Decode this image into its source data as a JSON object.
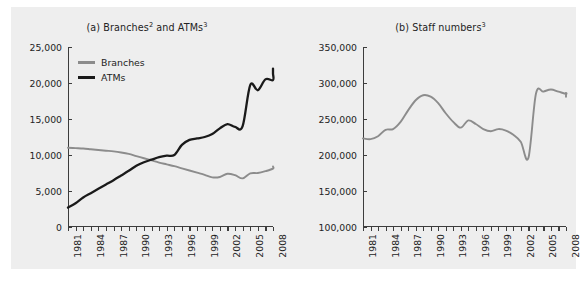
{
  "figure": {
    "background": "#eeeeee",
    "page_background": "#ffffff"
  },
  "panel_a": {
    "title_prefix": "(a) Branches",
    "title_sup1": "2",
    "title_mid": " and ATMs",
    "title_sup2": "3",
    "title_full": "(a) Branches2 and ATMs3"
  },
  "panel_b": {
    "title_prefix": "(b) Staff numbers",
    "title_sup1": "3",
    "title_full": "(b) Staff numbers3"
  },
  "legend": {
    "branches_label": "Branches",
    "branches_color": "#8c8c8c",
    "atms_label": "ATMs",
    "atms_color": "#1a1a1a"
  },
  "chart_data": [
    {
      "type": "line",
      "title": "(a) Branches2 and ATMs3",
      "xlabel": "",
      "ylabel": "",
      "xlim": [
        1981,
        2008
      ],
      "ylim": [
        0,
        25000
      ],
      "yticks": [
        0,
        5000,
        10000,
        15000,
        20000,
        25000
      ],
      "ytick_labels": [
        "0",
        "5,000",
        "10,000",
        "15,000",
        "20,000",
        "25,000"
      ],
      "xticks": [
        1981,
        1984,
        1987,
        1990,
        1993,
        1996,
        1999,
        2002,
        2005,
        2008
      ],
      "xtick_labels": [
        "1981",
        "1984",
        "1987",
        "1990",
        "1993",
        "1996",
        "1999",
        "2002",
        "2005",
        "2008"
      ],
      "x": [
        1981,
        1982,
        1983,
        1984,
        1985,
        1986,
        1987,
        1988,
        1989,
        1990,
        1991,
        1992,
        1993,
        1994,
        1995,
        1996,
        1997,
        1998,
        1999,
        2000,
        2001,
        2002,
        2003,
        2004,
        2005,
        2006,
        2007,
        2008
      ],
      "grid": false,
      "legend_position": "upper-left",
      "series": [
        {
          "name": "Branches",
          "color": "#8c8c8c",
          "values": [
            11000,
            10950,
            10900,
            10800,
            10700,
            10600,
            10500,
            10350,
            10150,
            9850,
            9550,
            9250,
            8950,
            8700,
            8450,
            8150,
            7850,
            7550,
            7250,
            6900,
            6950,
            7400,
            7200,
            6750,
            7450,
            7500,
            7750,
            8100,
            8400
          ]
        },
        {
          "name": "ATMs",
          "color": "#1a1a1a",
          "values": [
            2700,
            3300,
            4100,
            4700,
            5300,
            5900,
            6500,
            7150,
            7800,
            8500,
            9000,
            9350,
            9700,
            9900,
            10000,
            11400,
            12100,
            12300,
            12500,
            12900,
            13700,
            14300,
            13900,
            14000,
            19700,
            19000,
            20500,
            20400,
            21300,
            21700,
            22000
          ]
        }
      ]
    },
    {
      "type": "line",
      "title": "(b) Staff numbers3",
      "xlabel": "",
      "ylabel": "",
      "xlim": [
        1981,
        2008
      ],
      "ylim": [
        100000,
        350000
      ],
      "yticks": [
        100000,
        150000,
        200000,
        250000,
        300000,
        350000
      ],
      "ytick_labels": [
        "100,000",
        "150,000",
        "200,000",
        "250,000",
        "300,000",
        "350,000"
      ],
      "xticks": [
        1981,
        1984,
        1987,
        1990,
        1993,
        1996,
        1999,
        2002,
        2005,
        2008
      ],
      "xtick_labels": [
        "1981",
        "1984",
        "1987",
        "1990",
        "1993",
        "1996",
        "1999",
        "2002",
        "2005",
        "2008"
      ],
      "grid": false,
      "legend_position": "none",
      "series": [
        {
          "name": "Staff numbers",
          "color": "#8c8c8c",
          "x": [
            1981,
            1982,
            1983,
            1984,
            1985,
            1986,
            1987,
            1988,
            1989,
            1990,
            1991,
            1992,
            1993,
            1994,
            1995,
            1996,
            1997,
            1998,
            1999,
            2000,
            2001,
            2002,
            2003,
            2004,
            2005,
            2006,
            2007,
            2008
          ],
          "values": [
            223000,
            222000,
            226000,
            235000,
            236000,
            246000,
            262000,
            276000,
            283000,
            281000,
            272000,
            258000,
            246000,
            238000,
            248000,
            243000,
            236000,
            233000,
            236000,
            234000,
            228000,
            218000,
            196000,
            285000,
            288000,
            291000,
            288000,
            285000,
            286000,
            281000
          ]
        }
      ]
    }
  ]
}
